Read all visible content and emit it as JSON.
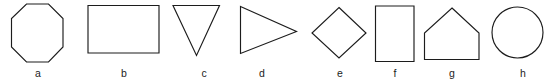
{
  "figure": {
    "width": 549,
    "height": 83,
    "background_color": "#ffffff",
    "stroke_color": "#1c1c1c",
    "label_color": "#1c1c1c",
    "caption_row_y": 67
  },
  "chart_data": {
    "type": "diagram",
    "title": "",
    "xlabel": "",
    "ylabel": "",
    "categories": [
      "a",
      "b",
      "c",
      "d",
      "e",
      "f",
      "g",
      "h"
    ],
    "values": [
      8,
      4,
      3,
      3,
      4,
      4,
      5,
      0
    ],
    "series": [
      {
        "name": "number_of_sides",
        "values": [
          8,
          4,
          3,
          3,
          4,
          4,
          5,
          0
        ]
      }
    ]
  },
  "shapes": [
    {
      "id": "shape-a",
      "label": "a",
      "name": "octagon",
      "sides": 8,
      "label_x": 38,
      "label_y": 67,
      "geometry": "polygon",
      "points": "26.5,4 48.5,4 63,18.5 63,47 48.5,62 26.5,62 11.5,47 11.5,18.5"
    },
    {
      "id": "shape-b",
      "label": "b",
      "name": "rectangle-landscape",
      "sides": 4,
      "label_x": 124,
      "label_y": 67,
      "geometry": "polygon",
      "points": "88,5.5 159,5.5 159,53 88,53"
    },
    {
      "id": "shape-c",
      "label": "c",
      "name": "triangle-down",
      "sides": 3,
      "label_x": 204,
      "label_y": 67,
      "geometry": "polygon",
      "points": "173,5.5 219.5,5.5 196.5,55.5"
    },
    {
      "id": "shape-d",
      "label": "d",
      "name": "triangle-right",
      "sides": 3,
      "label_x": 262,
      "label_y": 67,
      "geometry": "polygon",
      "points": "240.5,6.5 296.5,31.5 240.5,53.5"
    },
    {
      "id": "shape-e",
      "label": "e",
      "name": "diamond",
      "sides": 4,
      "label_x": 340,
      "label_y": 67,
      "geometry": "polygon",
      "points": "339,7.5 366,33 339,58 312,33"
    },
    {
      "id": "shape-f",
      "label": "f",
      "name": "rectangle-portrait",
      "sides": 4,
      "label_x": 395,
      "label_y": 67,
      "geometry": "polygon",
      "points": "375.5,6 414,6 414,61.5 375.5,61.5"
    },
    {
      "id": "shape-g",
      "label": "g",
      "name": "pentagon-house",
      "sides": 5,
      "label_x": 452,
      "label_y": 67,
      "geometry": "polygon",
      "points": "452,8 479,33 479,59.5 424.5,59.5 424.5,33"
    },
    {
      "id": "shape-h",
      "label": "h",
      "name": "circle",
      "sides": 0,
      "label_x": 523,
      "label_y": 67,
      "geometry": "circle",
      "cx": 517.5,
      "cy": 32.5,
      "r": 25.5
    }
  ]
}
